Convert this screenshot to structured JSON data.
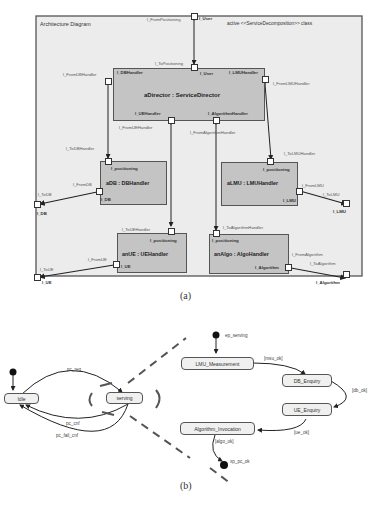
{
  "part_a": {
    "title": "Architecture Diagram",
    "stereotype": "active <<ServiceDecomposition>> class",
    "caption": "(a)",
    "colors": {
      "frame_bg": "#ececec",
      "capsule_fill": "#c4c4c4",
      "border": "#555555"
    },
    "external_ports": {
      "user": "l_User",
      "db": "l_DB",
      "ue": "l_UE",
      "lmu": "l_LMU",
      "algorithm": "l_Algorithm"
    },
    "connector_labels": {
      "from_positioning": "l_FromPositioning",
      "to_positioning": "l_ToPositioning",
      "from_db_handler": "l_FromDBHandler",
      "to_db_handler": "l_ToDBHandler",
      "from_lmu_handler": "l_FromLMUHandler",
      "to_lmu_handler": "l_ToLMUHandler",
      "from_ue_handler": "l_FromUEHandler",
      "to_ue_handler": "l_ToUEHandler",
      "from_algorithm_handler": "l_FromAlgorithmHandler",
      "to_algorithm_handler": "l_ToAlgorithmHandler",
      "from_db": "l_FromDB",
      "to_db": "l_ToDB",
      "from_ue": "l_FromUE",
      "to_ue": "l_ToUE",
      "from_lmu": "l_FromLMU",
      "to_lmu": "l_ToLMU",
      "from_algorithm": "l_FromAlgorithm",
      "to_algorithm": "l_ToAlgorithm"
    },
    "capsules": {
      "director": {
        "name": "aDirector : ServiceDirector",
        "ports": {
          "db_handler": "l_DBHandler",
          "user": "l_User",
          "lmu_handler": "l_LMUHandler",
          "ue_handler": "l_UEHandler",
          "algorithm_handler": "l_AlgorithmHandler"
        }
      },
      "db": {
        "name": "aDB : DBHandler",
        "ports": {
          "positioning": "l_positioning",
          "db": "l_DB"
        }
      },
      "lmu": {
        "name": "aLMU : LMUHandler",
        "ports": {
          "positioning": "l_positioning",
          "lmu": "l_LMU"
        }
      },
      "ue": {
        "name": "anUE : UEHandler",
        "ports": {
          "positioning": "l_positioning",
          "ue": "l_UE"
        }
      },
      "algo": {
        "name": "anAlgo : AlgoHandler",
        "ports": {
          "positioning": "l_positioning",
          "algorithm": "l_Algorithm"
        }
      }
    }
  },
  "part_b": {
    "caption": "(b)",
    "top_level": {
      "states": {
        "idle": "Idle",
        "serving": "serving"
      },
      "transitions": {
        "req": "pc_req",
        "cnf": "pc_cnf",
        "fail_cnf": "pc_fail_cnf"
      }
    },
    "submachine": {
      "entry_point": "ep_serving",
      "exit_point": "xp_pc_ok",
      "states": {
        "lmu": "LMU_Measurement",
        "db": "DB_Enquiry",
        "ue": "UE_Enquiry",
        "algo": "Algorithm_Invocation"
      },
      "guards": {
        "msu_ok": "[msu_ok]",
        "db_ok": "[db_ok]",
        "ue_ok": "[ue_ok]",
        "algo_ok": "[algo_ok]"
      }
    }
  }
}
